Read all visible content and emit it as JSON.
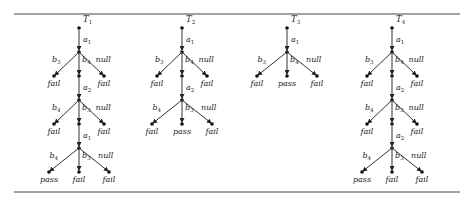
{
  "figure": {
    "trees": [
      {
        "title": "T1",
        "cx": 79,
        "levels": [
          {
            "spine": "a1",
            "left": "b3",
            "mid": "b4",
            "right": "null",
            "left_leaf": "fail",
            "mid_leaf": "",
            "right_leaf": "fail"
          },
          {
            "spine": "a2",
            "left": "b4",
            "mid": "b3",
            "right": "null",
            "left_leaf": "fail",
            "mid_leaf": "",
            "right_leaf": "fail"
          },
          {
            "spine": "a1",
            "left": "b4",
            "mid": "b3",
            "right": "null",
            "left_leaf": "pass",
            "mid_leaf": "fail",
            "right_leaf": "fail"
          }
        ]
      },
      {
        "title": "T2",
        "cx": 182,
        "levels": [
          {
            "spine": "a1",
            "left": "b3",
            "mid": "b4",
            "right": "null",
            "left_leaf": "fail",
            "mid_leaf": "",
            "right_leaf": "fail"
          },
          {
            "spine": "a2",
            "left": "b4",
            "mid": "b3",
            "right": "null",
            "left_leaf": "fail",
            "mid_leaf": "pass",
            "right_leaf": "fail"
          }
        ]
      },
      {
        "title": "T3",
        "cx": 287,
        "levels": [
          {
            "spine": "a1",
            "left": "b3",
            "mid": "b4",
            "right": "null",
            "left_leaf": "fail",
            "mid_leaf": "pass",
            "right_leaf": "fail"
          }
        ]
      },
      {
        "title": "T4",
        "cx": 392,
        "levels": [
          {
            "spine": "a1",
            "left": "b3",
            "mid": "b4",
            "right": "null",
            "left_leaf": "fail",
            "mid_leaf": "",
            "right_leaf": "fail"
          },
          {
            "spine": "a2",
            "left": "b4",
            "mid": "b3",
            "right": "null",
            "left_leaf": "fail",
            "mid_leaf": "",
            "right_leaf": "fail"
          },
          {
            "spine": "a2",
            "left": "b4",
            "mid": "b3",
            "right": "null",
            "left_leaf": "pass",
            "mid_leaf": "fail",
            "right_leaf": "fail"
          }
        ]
      }
    ]
  }
}
